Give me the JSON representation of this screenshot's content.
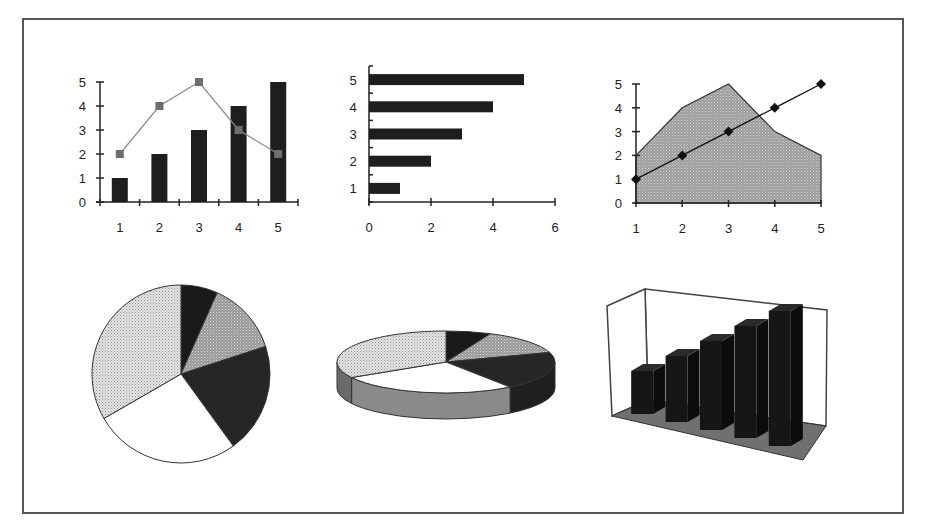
{
  "colors": {
    "frame": "#555555",
    "axis": "#222222",
    "bar_dark": "#1e1e1e",
    "line_gray": "#8a8a8a",
    "marker_gray": "#6e6e6e",
    "area_fill": "#a8a8a8",
    "pie_black": "#1a1a1a",
    "pie_gray": "#a4a4a4",
    "pie_dark": "#262626",
    "pie_white": "#ffffff",
    "pie_dotted": "#d4d4d4",
    "floor": "#707070"
  },
  "chart_data": [
    {
      "id": "combo-column-line",
      "type": "bar",
      "title": "",
      "xlabel": "",
      "ylabel": "",
      "categories": [
        "1",
        "2",
        "3",
        "4",
        "5"
      ],
      "series": [
        {
          "name": "columns",
          "type": "bar",
          "values": [
            1,
            2,
            3,
            4,
            5
          ]
        },
        {
          "name": "line",
          "type": "line",
          "marker": "square",
          "values": [
            2,
            4,
            5,
            3,
            2
          ]
        }
      ],
      "yticks": [
        "0",
        "1",
        "2",
        "3",
        "4",
        "5"
      ],
      "ylim": [
        0,
        5
      ],
      "grid": false,
      "legend": "none"
    },
    {
      "id": "horizontal-bar",
      "type": "bar",
      "orientation": "horizontal",
      "title": "",
      "xlabel": "",
      "ylabel": "",
      "categories": [
        "1",
        "2",
        "3",
        "4",
        "5"
      ],
      "values": [
        1,
        2,
        3,
        4,
        5
      ],
      "xticks": [
        "0",
        "2",
        "4",
        "6"
      ],
      "xlim": [
        0,
        6
      ],
      "grid": false,
      "legend": "none"
    },
    {
      "id": "area-line",
      "type": "area",
      "title": "",
      "xlabel": "",
      "ylabel": "",
      "x": [
        1,
        2,
        3,
        4,
        5
      ],
      "series": [
        {
          "name": "area",
          "type": "area",
          "values": [
            2,
            4,
            5,
            3,
            2
          ]
        },
        {
          "name": "line",
          "type": "line",
          "marker": "diamond",
          "values": [
            1,
            2,
            3,
            4,
            5
          ]
        }
      ],
      "xticks": [
        "1",
        "2",
        "3",
        "4",
        "5"
      ],
      "yticks": [
        "0",
        "1",
        "2",
        "3",
        "4",
        "5"
      ],
      "ylim": [
        0,
        5
      ],
      "grid": false,
      "legend": "none"
    },
    {
      "id": "pie-2d",
      "type": "pie",
      "title": "",
      "slices": [
        {
          "label": "1",
          "value": 1,
          "fill": "black"
        },
        {
          "label": "2",
          "value": 2,
          "fill": "gray-dotted"
        },
        {
          "label": "3",
          "value": 3,
          "fill": "dark"
        },
        {
          "label": "4",
          "value": 4,
          "fill": "white"
        },
        {
          "label": "5",
          "value": 5,
          "fill": "light-dotted"
        }
      ],
      "start_angle_deg": 0,
      "direction": "clockwise",
      "legend": "none"
    },
    {
      "id": "pie-3d",
      "type": "pie",
      "style": "3d",
      "title": "",
      "slices": [
        {
          "label": "1",
          "value": 1,
          "fill": "black"
        },
        {
          "label": "2",
          "value": 2,
          "fill": "gray-dotted"
        },
        {
          "label": "3",
          "value": 3,
          "fill": "dark"
        },
        {
          "label": "4",
          "value": 4,
          "fill": "white"
        },
        {
          "label": "5",
          "value": 5,
          "fill": "light-dotted"
        }
      ],
      "legend": "none"
    },
    {
      "id": "column-3d",
      "type": "bar",
      "style": "3d",
      "title": "",
      "categories": [
        "1",
        "2",
        "3",
        "4",
        "5"
      ],
      "values": [
        1,
        2,
        3,
        4,
        5
      ],
      "axis_labels_visible": false,
      "legend": "none"
    }
  ]
}
